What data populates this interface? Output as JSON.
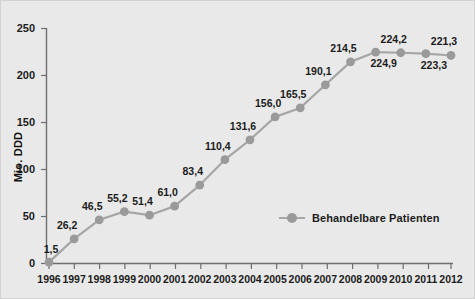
{
  "chart_data": {
    "type": "line",
    "title": "",
    "subtitle": "",
    "xlabel": "",
    "ylabel": "Mio. DDD",
    "categories": [
      "1996",
      "1997",
      "1998",
      "1999",
      "2000",
      "2001",
      "2002",
      "2003",
      "2004",
      "2005",
      "2006",
      "2007",
      "2008",
      "2009",
      "2010",
      "2011",
      "2012"
    ],
    "x_tick_labels": [
      "1996",
      "1997",
      "1998",
      "1999",
      "2000",
      "2001",
      "2002",
      "2003",
      "2004",
      "2005",
      "2006",
      "2007",
      "2008",
      "2009",
      "2010",
      "2011",
      "2012"
    ],
    "y_tick_labels": [
      "0",
      "50",
      "100",
      "150",
      "200",
      "250"
    ],
    "y_ticks": [
      0,
      50,
      100,
      150,
      200,
      250
    ],
    "ylim": [
      0,
      250
    ],
    "grid": false,
    "legend_position": "inside-right",
    "series": [
      {
        "name": "Behandelbare Patienten",
        "color": "#9a9a9a",
        "line_color": "#a6a6a6",
        "values": [
          1.5,
          26.2,
          46.5,
          55.2,
          51.4,
          61.0,
          83.4,
          110.4,
          131.6,
          156.0,
          165.5,
          190.1,
          214.5,
          224.9,
          224.2,
          223.3,
          221.3
        ],
        "data_labels": [
          "1,5",
          "26,2",
          "46,5",
          "55,2",
          "51,4",
          "61,0",
          "83,4",
          "110,4",
          "131,6",
          "156,0",
          "165,5",
          "190,1",
          "214,5",
          "224,9",
          "224,2",
          "223,3",
          "221,3"
        ],
        "label_placement": [
          "above-left",
          "above-left",
          "above-left",
          "above-left",
          "above-left",
          "above-left",
          "above-left",
          "above-left",
          "above-left",
          "above-left",
          "above-left",
          "above-left",
          "above-left",
          "below-right",
          "above-left",
          "below-right",
          "above-left"
        ]
      }
    ],
    "legend": [
      {
        "label": "Behandelbare Patienten",
        "color": "#9a9a9a"
      }
    ],
    "colors": {
      "background": "#e9e9e9",
      "axis": "#6e6e6e",
      "marker": "#9a9a9a",
      "line": "#a6a6a6",
      "text": "#1c1c1c",
      "border": "#d2d2d2"
    }
  }
}
